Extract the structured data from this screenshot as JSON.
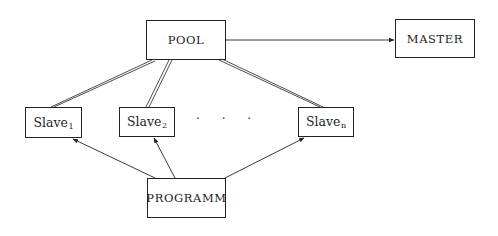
{
  "diagram": {
    "type": "master-slave pool architecture",
    "nodes": {
      "pool": {
        "label": "POOL"
      },
      "master": {
        "label": "MASTER"
      },
      "slave1": {
        "label": "Slave",
        "sub": "1"
      },
      "slave2": {
        "label": "Slave",
        "sub": "2"
      },
      "slaven": {
        "label": "Slave",
        "sub": "n"
      },
      "programm": {
        "label": "PROGRAMM"
      }
    },
    "ellipsis": "· · ·",
    "edges": [
      {
        "from": "POOL",
        "to": "MASTER",
        "style": "single-arrow"
      },
      {
        "from": "POOL",
        "to": "Slave1",
        "style": "double-line"
      },
      {
        "from": "POOL",
        "to": "Slave2",
        "style": "double-line"
      },
      {
        "from": "POOL",
        "to": "Slaven",
        "style": "double-line"
      },
      {
        "from": "PROGRAMM",
        "to": "Slave1",
        "style": "single-arrow"
      },
      {
        "from": "PROGRAMM",
        "to": "Slave2",
        "style": "single-arrow"
      },
      {
        "from": "PROGRAMM",
        "to": "Slaven",
        "style": "single-arrow"
      }
    ],
    "colors": {
      "line": "#222222",
      "background": "#ffffff"
    }
  }
}
